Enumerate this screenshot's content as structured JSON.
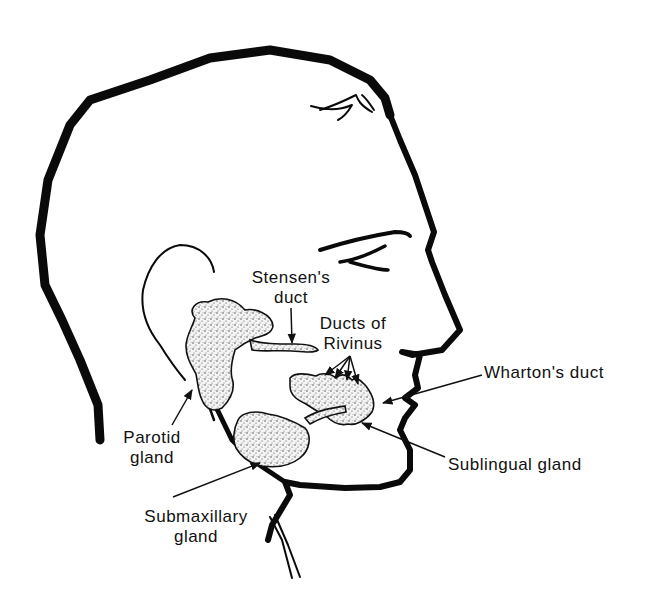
{
  "figure": {
    "colors": {
      "ink": "#0a0a0a",
      "background": "#ffffff",
      "gland_fill": "#f2f2f2"
    }
  },
  "labels": {
    "stensens_duct": {
      "line1": "Stensen's",
      "line2": "duct"
    },
    "ducts_of_rivinus": {
      "line1": "Ducts of",
      "line2": "Rivinus"
    },
    "whartons_duct": {
      "line1": "Wharton's duct"
    },
    "parotid_gland": {
      "line1": "Parotid",
      "line2": "gland"
    },
    "sublingual_gland": {
      "line1": "Sublingual gland"
    },
    "submaxillary_gland": {
      "line1": "Submaxillary",
      "line2": "gland"
    }
  }
}
